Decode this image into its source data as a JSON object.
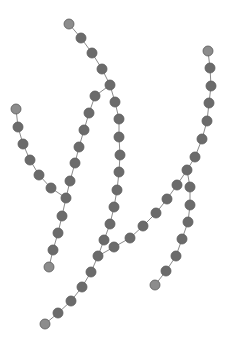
{
  "diagram": {
    "type": "tree-graph",
    "node_color": "#6b6b6b",
    "leaf_color": "#8c8c8c",
    "edge_color": "#8a8a8a",
    "node_radius": 5,
    "nodes": [
      {
        "id": "n1",
        "x": 69,
        "y": 24,
        "leaf": true
      },
      {
        "id": "n2",
        "x": 81,
        "y": 38
      },
      {
        "id": "n3",
        "x": 92,
        "y": 53
      },
      {
        "id": "n4",
        "x": 102,
        "y": 69
      },
      {
        "id": "n5",
        "x": 110,
        "y": 85
      },
      {
        "id": "n6",
        "x": 95,
        "y": 96
      },
      {
        "id": "n7",
        "x": 89,
        "y": 113
      },
      {
        "id": "n8",
        "x": 84,
        "y": 130
      },
      {
        "id": "n9",
        "x": 79,
        "y": 147
      },
      {
        "id": "n10",
        "x": 75,
        "y": 163
      },
      {
        "id": "n11",
        "x": 70,
        "y": 181
      },
      {
        "id": "n12",
        "x": 66,
        "y": 198
      },
      {
        "id": "n13",
        "x": 62,
        "y": 216
      },
      {
        "id": "n14",
        "x": 58,
        "y": 233
      },
      {
        "id": "n15",
        "x": 53,
        "y": 250
      },
      {
        "id": "n16",
        "x": 49,
        "y": 267,
        "leaf": true
      },
      {
        "id": "n17",
        "x": 16,
        "y": 109,
        "leaf": true
      },
      {
        "id": "n18",
        "x": 18,
        "y": 127
      },
      {
        "id": "n19",
        "x": 23,
        "y": 144
      },
      {
        "id": "n20",
        "x": 30,
        "y": 160
      },
      {
        "id": "n21",
        "x": 39,
        "y": 175
      },
      {
        "id": "n22",
        "x": 51,
        "y": 188
      },
      {
        "id": "n23",
        "x": 115,
        "y": 102
      },
      {
        "id": "n24",
        "x": 119,
        "y": 119
      },
      {
        "id": "n25",
        "x": 119,
        "y": 137
      },
      {
        "id": "n26",
        "x": 120,
        "y": 155
      },
      {
        "id": "n27",
        "x": 119,
        "y": 172
      },
      {
        "id": "n28",
        "x": 117,
        "y": 190
      },
      {
        "id": "n29",
        "x": 114,
        "y": 207
      },
      {
        "id": "n30",
        "x": 110,
        "y": 224
      },
      {
        "id": "n31",
        "x": 104,
        "y": 240
      },
      {
        "id": "n32",
        "x": 98,
        "y": 256
      },
      {
        "id": "n33",
        "x": 91,
        "y": 272
      },
      {
        "id": "n34",
        "x": 82,
        "y": 287
      },
      {
        "id": "n35",
        "x": 71,
        "y": 301
      },
      {
        "id": "n36",
        "x": 58,
        "y": 313
      },
      {
        "id": "n37",
        "x": 45,
        "y": 324,
        "leaf": true
      },
      {
        "id": "n38",
        "x": 114,
        "y": 247
      },
      {
        "id": "n39",
        "x": 130,
        "y": 238
      },
      {
        "id": "n40",
        "x": 143,
        "y": 226
      },
      {
        "id": "n41",
        "x": 156,
        "y": 213
      },
      {
        "id": "n42",
        "x": 167,
        "y": 199
      },
      {
        "id": "n43",
        "x": 177,
        "y": 185
      },
      {
        "id": "n44",
        "x": 187,
        "y": 170
      },
      {
        "id": "n45",
        "x": 195,
        "y": 157
      },
      {
        "id": "n46",
        "x": 202,
        "y": 139
      },
      {
        "id": "n47",
        "x": 207,
        "y": 121
      },
      {
        "id": "n48",
        "x": 209,
        "y": 103
      },
      {
        "id": "n49",
        "x": 211,
        "y": 86
      },
      {
        "id": "n50",
        "x": 210,
        "y": 68
      },
      {
        "id": "n51",
        "x": 208,
        "y": 51,
        "leaf": true
      },
      {
        "id": "n52",
        "x": 190,
        "y": 187
      },
      {
        "id": "n53",
        "x": 190,
        "y": 205
      },
      {
        "id": "n54",
        "x": 188,
        "y": 222
      },
      {
        "id": "n55",
        "x": 182,
        "y": 239
      },
      {
        "id": "n56",
        "x": 176,
        "y": 256
      },
      {
        "id": "n57",
        "x": 166,
        "y": 271
      },
      {
        "id": "n58",
        "x": 155,
        "y": 285,
        "leaf": true
      }
    ],
    "edges": [
      [
        "n1",
        "n2"
      ],
      [
        "n2",
        "n3"
      ],
      [
        "n3",
        "n4"
      ],
      [
        "n4",
        "n5"
      ],
      [
        "n5",
        "n6"
      ],
      [
        "n6",
        "n7"
      ],
      [
        "n7",
        "n8"
      ],
      [
        "n8",
        "n9"
      ],
      [
        "n9",
        "n10"
      ],
      [
        "n10",
        "n11"
      ],
      [
        "n11",
        "n12"
      ],
      [
        "n12",
        "n13"
      ],
      [
        "n13",
        "n14"
      ],
      [
        "n14",
        "n15"
      ],
      [
        "n15",
        "n16"
      ],
      [
        "n17",
        "n18"
      ],
      [
        "n18",
        "n19"
      ],
      [
        "n19",
        "n20"
      ],
      [
        "n20",
        "n21"
      ],
      [
        "n21",
        "n22"
      ],
      [
        "n22",
        "n12"
      ],
      [
        "n5",
        "n23"
      ],
      [
        "n23",
        "n24"
      ],
      [
        "n24",
        "n25"
      ],
      [
        "n25",
        "n26"
      ],
      [
        "n26",
        "n27"
      ],
      [
        "n27",
        "n28"
      ],
      [
        "n28",
        "n29"
      ],
      [
        "n29",
        "n30"
      ],
      [
        "n30",
        "n31"
      ],
      [
        "n31",
        "n32"
      ],
      [
        "n32",
        "n33"
      ],
      [
        "n33",
        "n34"
      ],
      [
        "n34",
        "n35"
      ],
      [
        "n35",
        "n36"
      ],
      [
        "n36",
        "n37"
      ],
      [
        "n32",
        "n38"
      ],
      [
        "n38",
        "n39"
      ],
      [
        "n39",
        "n40"
      ],
      [
        "n40",
        "n41"
      ],
      [
        "n41",
        "n42"
      ],
      [
        "n42",
        "n43"
      ],
      [
        "n43",
        "n44"
      ],
      [
        "n44",
        "n45"
      ],
      [
        "n45",
        "n46"
      ],
      [
        "n46",
        "n47"
      ],
      [
        "n47",
        "n48"
      ],
      [
        "n48",
        "n49"
      ],
      [
        "n49",
        "n50"
      ],
      [
        "n50",
        "n51"
      ],
      [
        "n44",
        "n52"
      ],
      [
        "n52",
        "n53"
      ],
      [
        "n53",
        "n54"
      ],
      [
        "n54",
        "n55"
      ],
      [
        "n55",
        "n56"
      ],
      [
        "n56",
        "n57"
      ],
      [
        "n57",
        "n58"
      ]
    ]
  }
}
